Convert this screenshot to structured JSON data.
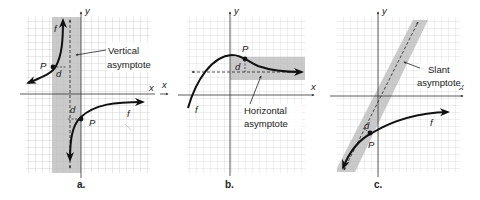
{
  "panels": [
    {
      "id": "a",
      "caption": "a.",
      "x_axis_label": "x",
      "y_axis_label": "y",
      "function_label": "f",
      "point_label": "P",
      "distance_label": "d",
      "asymptote_label_line1": "Vertical",
      "asymptote_label_line2": "asymptote",
      "asymptote_type": "vertical"
    },
    {
      "id": "b",
      "caption": "b.",
      "x_axis_label": "x",
      "y_axis_label": "y",
      "function_label": "f",
      "point_label": "P",
      "distance_label": "d",
      "asymptote_label_line1": "Horizontal",
      "asymptote_label_line2": "asymptote",
      "asymptote_type": "horizontal"
    },
    {
      "id": "c",
      "caption": "c.",
      "x_axis_label": "x",
      "y_axis_label": "y",
      "function_label": "f",
      "point_label": "P",
      "distance_label": "d",
      "asymptote_label_line1": "Slant",
      "asymptote_label_line2": "asymptote",
      "asymptote_type": "slant"
    }
  ],
  "colors": {
    "grid": "#c8c8c8",
    "band": "#b4b4b4",
    "curve": "#111111",
    "axis": "#333333"
  }
}
